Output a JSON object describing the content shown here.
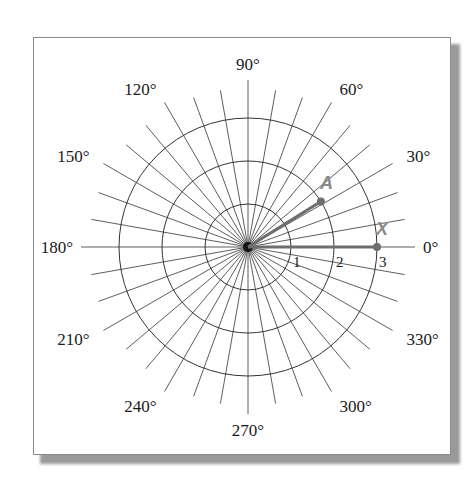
{
  "diagram": {
    "type": "polar-grid",
    "center": [
      248,
      247
    ],
    "unit_px": 43,
    "rings": [
      1,
      2,
      3
    ],
    "spoke_step_deg": 10,
    "spoke_length_px": 167,
    "angle_labels": [
      {
        "deg": 0,
        "text": "0°"
      },
      {
        "deg": 30,
        "text": "30°"
      },
      {
        "deg": 60,
        "text": "60°"
      },
      {
        "deg": 90,
        "text": "90°"
      },
      {
        "deg": 120,
        "text": "120°"
      },
      {
        "deg": 150,
        "text": "150°"
      },
      {
        "deg": 180,
        "text": "180°"
      },
      {
        "deg": 210,
        "text": "210°"
      },
      {
        "deg": 240,
        "text": "240°"
      },
      {
        "deg": 270,
        "text": "270°"
      },
      {
        "deg": 300,
        "text": "300°"
      },
      {
        "deg": 330,
        "text": "330°"
      }
    ],
    "ring_labels": [
      {
        "r": 1,
        "text": "1"
      },
      {
        "r": 2,
        "text": "2"
      },
      {
        "r": 3,
        "text": "3"
      }
    ],
    "vectors": [
      {
        "name": "A",
        "r": 2,
        "deg": 32,
        "color": "#6e6e6e"
      },
      {
        "name": "X",
        "r": 3,
        "deg": 0,
        "color": "#6e6e6e"
      }
    ],
    "colors": {
      "grid": "#333333",
      "vector": "#6e6e6e",
      "label": "#1a1a1a",
      "vector_label": "#8a8a8a"
    }
  }
}
